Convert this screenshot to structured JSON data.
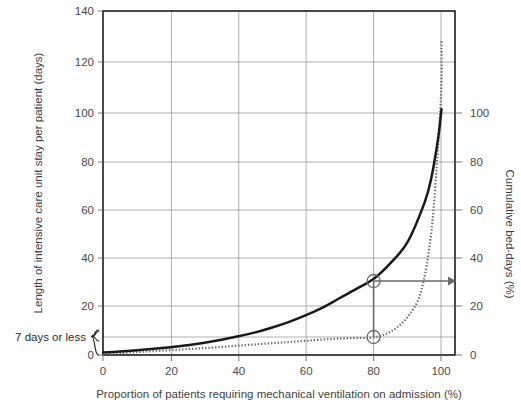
{
  "chart_data": {
    "type": "line",
    "title": "",
    "xlabel": "Proportion of patients requiring mechanical ventilation on admission (%)",
    "ylabel": "Length of intensive care unit stay per patient (days)",
    "y2label": "Cumulative bed-days (%)",
    "xlim": [
      0,
      104
    ],
    "ylim": [
      0,
      140
    ],
    "y2lim": [
      0,
      104
    ],
    "grid": true,
    "legend": "none",
    "xticks": [
      0,
      20,
      40,
      60,
      80,
      100
    ],
    "xtick_labels": [
      "0",
      "20",
      "40",
      "60",
      "80",
      "100"
    ],
    "yticks": [
      0,
      20,
      40,
      60,
      80,
      100,
      120,
      140
    ],
    "ytick_labels": [
      "0",
      "20",
      "40",
      "60",
      "80",
      "100",
      "120",
      "140"
    ],
    "y2ticks": [
      0,
      20,
      40,
      60,
      80,
      100
    ],
    "y2tick_labels": [
      "0",
      "20",
      "40",
      "60",
      "80",
      "100"
    ],
    "series": [
      {
        "name": "Length of intensive care unit stay per patient (days)",
        "style": "solid",
        "axis": "left",
        "x": [
          0,
          5,
          10,
          15,
          20,
          25,
          30,
          35,
          40,
          45,
          50,
          55,
          60,
          65,
          70,
          75,
          80,
          85,
          90,
          95,
          97,
          99,
          100
        ],
        "values": [
          1.0,
          1.4,
          1.9,
          2.5,
          3.2,
          4.0,
          5.0,
          6.2,
          7.6,
          9.2,
          11.2,
          13.5,
          16.2,
          19.4,
          23.2,
          27.0,
          31.0,
          37.5,
          46.0,
          62.0,
          72.0,
          88.0,
          100.0
        ]
      },
      {
        "name": "Cumulative bed-days (%)",
        "style": "dotted",
        "axis": "left",
        "x": [
          0,
          5,
          10,
          15,
          20,
          25,
          30,
          35,
          40,
          45,
          50,
          55,
          60,
          65,
          70,
          75,
          80,
          85,
          90,
          94,
          97,
          99,
          100,
          100
        ],
        "values": [
          0.5,
          0.8,
          1.2,
          1.6,
          2.0,
          2.4,
          2.8,
          3.3,
          3.8,
          4.3,
          4.8,
          5.3,
          5.8,
          6.3,
          6.7,
          6.9,
          7.2,
          9.5,
          15.5,
          26.0,
          50.0,
          85.0,
          110.0,
          128.0
        ]
      }
    ],
    "annotations": [
      {
        "name": "brace-label",
        "text": "7 days or less",
        "type": "brace",
        "y_from": 0,
        "y_to": 7
      },
      {
        "name": "reference-marker-upper",
        "type": "circle-marker",
        "x": 80,
        "y": 31
      },
      {
        "name": "reference-marker-lower",
        "type": "circle-marker",
        "x": 80,
        "y": 7.2
      },
      {
        "name": "reference-arrow",
        "type": "arrow",
        "from_x": 80,
        "from_y": 31,
        "to_x": 104,
        "to_y": 31,
        "reads_right_axis_value": 30
      },
      {
        "name": "reference-vertical",
        "type": "segment",
        "x": 80,
        "y_from": 7.2,
        "y_to": 31
      },
      {
        "name": "seven-day-line",
        "type": "hline",
        "y": 7
      }
    ]
  }
}
